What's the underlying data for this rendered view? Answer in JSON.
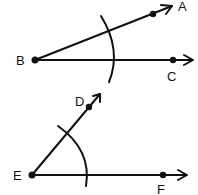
{
  "diagram": {
    "colors": {
      "ink": "#111111",
      "background": "#ffffff"
    },
    "top_figure": {
      "vertex": {
        "label": "B",
        "x": 35,
        "y": 60
      },
      "rays": [
        {
          "name": "BA",
          "point_label": "A",
          "point": [
            153,
            14
          ],
          "tip": [
            173,
            6
          ],
          "label_pos": [
            180,
            10
          ]
        },
        {
          "name": "BC",
          "point_label": "C",
          "point": [
            173,
            60
          ],
          "tip": [
            193,
            60
          ],
          "label_pos": [
            168,
            80
          ]
        }
      ],
      "arc": {
        "from": [
          101,
          16
        ],
        "ctrl": [
          122,
          50
        ],
        "to": [
          109,
          82
        ]
      }
    },
    "bottom_figure": {
      "vertex": {
        "label": "E",
        "x": 32,
        "y": 175
      },
      "rays": [
        {
          "name": "ED",
          "point_label": "D",
          "point": [
            89,
            107
          ],
          "tip": [
            100,
            94
          ],
          "label_pos": [
            75,
            105
          ]
        },
        {
          "name": "EF",
          "point_label": "F",
          "point": [
            163,
            175
          ],
          "tip": [
            187,
            175
          ],
          "label_pos": [
            158,
            193
          ]
        }
      ],
      "arc": {
        "from": [
          58,
          126
        ],
        "ctrl": [
          92,
          150
        ],
        "to": [
          86,
          186
        ]
      }
    },
    "labels": {
      "A": "A",
      "B": "B",
      "C": "C",
      "D": "D",
      "E": "E",
      "F": "F"
    }
  }
}
